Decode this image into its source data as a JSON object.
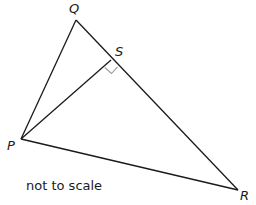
{
  "diagram": {
    "vertices": {
      "Q": {
        "label": "Q",
        "x": 76,
        "y": 20
      },
      "S": {
        "label": "S",
        "x": 111,
        "y": 60
      },
      "P": {
        "label": "P",
        "x": 21,
        "y": 139
      },
      "R": {
        "label": "R",
        "x": 238,
        "y": 190
      }
    },
    "segments": [
      "PQ",
      "QR",
      "PR",
      "PS"
    ],
    "right_angle_at": "S",
    "note": "not to scale",
    "colors": {
      "line": "#1a1a1a",
      "right_angle_marker": "#9a9a9a",
      "background": "#ffffff"
    }
  }
}
